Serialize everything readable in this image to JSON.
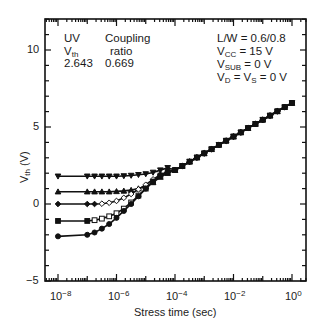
{
  "chart_data": {
    "type": "line",
    "title": "",
    "xlabel": "Stress time (sec)",
    "ylabel": "V_th (V)",
    "xscale": "log",
    "xlim_log10": [
      -8.45,
      0.45
    ],
    "ylim": [
      -5,
      12
    ],
    "x_ticks": [
      "10^-8",
      "10^-6",
      "10^-4",
      "10^-2",
      "10^0"
    ],
    "y_ticks": [
      -5,
      0,
      5,
      10
    ],
    "grid": false,
    "legend_table": {
      "headers": [
        "UV V_th",
        "Coupling ratio"
      ],
      "row": [
        "2.643",
        "0.669"
      ]
    },
    "conditions": [
      "L/W = 0.6/0.8",
      "V_CC = 15 V",
      "V_SUB = 0 V",
      "V_D = V_S = 0 V"
    ],
    "x_log10": [
      -8,
      -7,
      -6.75,
      -6.5,
      -6.25,
      -6,
      -5.75,
      -5.5,
      -5.25,
      -5,
      -4.75,
      -4.5,
      -4.25,
      -4,
      -3.75,
      -3.5,
      -3.25,
      -3,
      -2.75,
      -2.5,
      -2.25,
      -2,
      -1.75,
      -1.5,
      -1.25,
      -1,
      -0.75,
      -0.5,
      -0.25,
      0
    ],
    "series": [
      {
        "name": "initial V_th 1.8 V",
        "marker": "triangle-down",
        "filled": true,
        "values": [
          1.8,
          1.8,
          1.8,
          1.8,
          1.8,
          1.8,
          1.82,
          1.85,
          1.9,
          1.95,
          2.05,
          2.2,
          2.35,
          2.2,
          2.47,
          2.75,
          3.02,
          3.29,
          3.56,
          3.84,
          4.11,
          4.38,
          4.65,
          4.93,
          5.2,
          5.47,
          5.74,
          6.02,
          6.29,
          6.56
        ]
      },
      {
        "name": "initial V_th 0.8 V",
        "marker": "triangle-up",
        "filled": true,
        "values": [
          0.8,
          0.8,
          0.8,
          0.8,
          0.8,
          0.82,
          0.85,
          0.9,
          1.0,
          1.15,
          1.4,
          1.75,
          2.0,
          2.2,
          2.47,
          2.75,
          3.02,
          3.29,
          3.56,
          3.84,
          4.11,
          4.38,
          4.65,
          4.93,
          5.2,
          5.47,
          5.74,
          6.02,
          6.29,
          6.56
        ]
      },
      {
        "name": "initial V_th 0 V",
        "marker": "diamond",
        "filled": "open between 1e-6 and 1e-5",
        "values": [
          0.0,
          0.0,
          0.0,
          0.02,
          0.08,
          0.2,
          0.4,
          0.65,
          0.95,
          1.25,
          1.6,
          1.9,
          2.1,
          2.2,
          2.47,
          2.75,
          3.02,
          3.29,
          3.56,
          3.84,
          4.11,
          4.38,
          4.65,
          4.93,
          5.2,
          5.47,
          5.74,
          6.02,
          6.29,
          6.56
        ]
      },
      {
        "name": "initial V_th -1.1 V",
        "marker": "square",
        "filled": "open between 3e-7 and 1e-5",
        "values": [
          -1.1,
          -1.1,
          -1.05,
          -0.95,
          -0.8,
          -0.6,
          -0.3,
          0.1,
          0.55,
          1.0,
          1.45,
          1.85,
          2.08,
          2.2,
          2.47,
          2.75,
          3.02,
          3.29,
          3.56,
          3.84,
          4.11,
          4.38,
          4.65,
          4.93,
          5.2,
          5.47,
          5.74,
          6.02,
          6.29,
          6.56
        ]
      },
      {
        "name": "initial V_th -2.1 V",
        "marker": "circle",
        "filled": true,
        "values": [
          -2.1,
          -2.0,
          -1.85,
          -1.6,
          -1.3,
          -0.9,
          -0.45,
          0.0,
          0.5,
          1.0,
          1.45,
          1.85,
          2.08,
          2.2,
          2.47,
          2.75,
          3.02,
          3.29,
          3.56,
          3.84,
          4.11,
          4.38,
          4.65,
          4.93,
          5.2,
          5.47,
          5.74,
          6.02,
          6.29,
          6.56
        ]
      }
    ]
  },
  "annotations": {
    "uv_label": "UV",
    "vth_main": "V",
    "vth_sub": "th",
    "vth_value": "2.643",
    "coupling_label": "Coupling",
    "ratio_label": "ratio",
    "ratio_value": "0.669",
    "lw": "L/W = 0.6/0.8",
    "vcc_main": "V",
    "vcc_sub": "CC",
    "vcc_rest": " = 15 V",
    "vsub_main": "V",
    "vsub_sub": "SUB",
    "vsub_rest": " = 0 V",
    "vd_main": "V",
    "vd_sub": "D",
    "vd_mid": " = V",
    "vs_sub": "S",
    "vd_rest": " = 0 V"
  },
  "axes": {
    "y_tick_labels": [
      "10",
      "5",
      "0",
      "−5"
    ],
    "x_tick_base": "10",
    "x_tick_exps": [
      "−8",
      "−6",
      "−4",
      "−2",
      "0"
    ],
    "xlabel": "Stress time (sec)",
    "ylabel_main": "V",
    "ylabel_sub": "th",
    "ylabel_rest": " (V)"
  }
}
